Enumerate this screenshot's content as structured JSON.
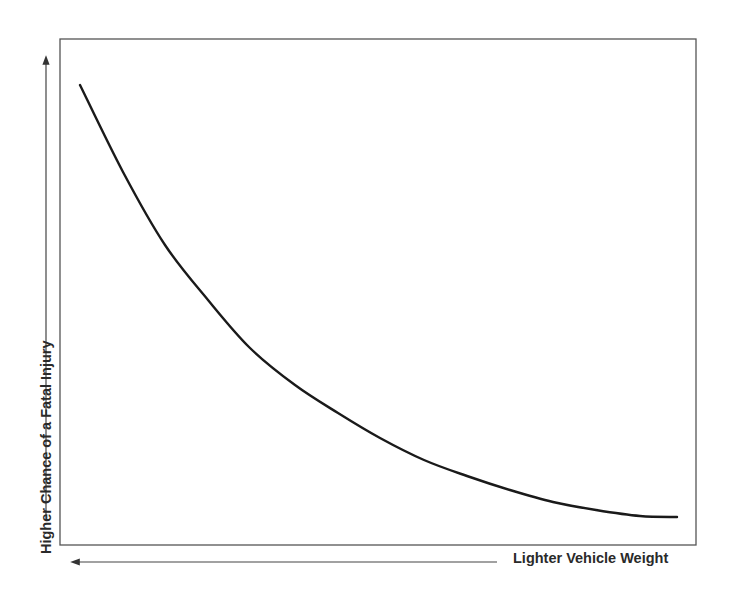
{
  "chart_data": {
    "type": "line",
    "title": "",
    "xlabel": "Lighter Vehicle Weight",
    "ylabel": "Higher Chance of a Fatal Injury",
    "x_direction": "arrow pointing left (lighter toward left)",
    "y_direction": "arrow pointing up (higher chance upward)",
    "grid": false,
    "legend": null,
    "axis_ticks": "none",
    "series": [
      {
        "name": "Fatal injury chance vs vehicle weight",
        "color": "#1a1a1a",
        "points_px": [
          [
            80,
            85
          ],
          [
            123,
            172
          ],
          [
            165,
            245
          ],
          [
            208,
            300
          ],
          [
            250,
            348
          ],
          [
            295,
            385
          ],
          [
            338,
            413
          ],
          [
            380,
            438
          ],
          [
            424,
            460
          ],
          [
            467,
            476
          ],
          [
            510,
            490
          ],
          [
            553,
            502
          ],
          [
            596,
            510
          ],
          [
            640,
            516
          ],
          [
            677,
            517
          ]
        ],
        "shape": "decreasing convex curve (exponential decay)"
      }
    ]
  },
  "labels": {
    "x_axis": "Lighter Vehicle Weight",
    "y_axis": "Higher Chance of a Fatal Injury"
  }
}
